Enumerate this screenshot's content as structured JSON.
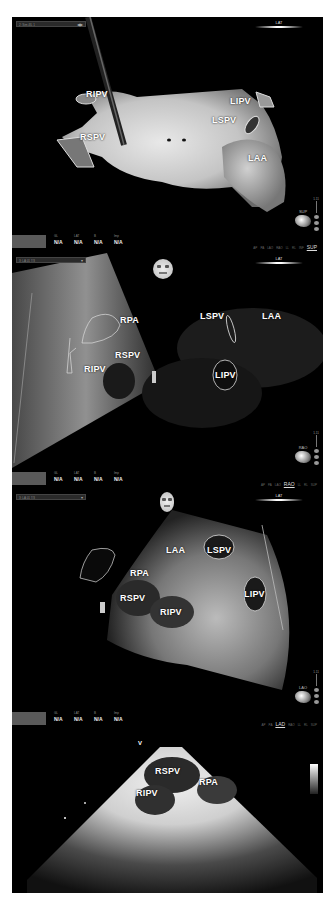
{
  "panels": [
    {
      "id": "A",
      "header": {
        "title": "2: Sim 4IL 1",
        "dropdown": "◀▶"
      },
      "orientation": "LAT",
      "labels": [
        "RIPV",
        "RSPV",
        "LIPV",
        "LSPV",
        "LAA"
      ],
      "view_label": "SUP",
      "status": {
        "keys": [
          "GL",
          "LAT",
          "B",
          "Imp"
        ],
        "values": [
          "N/A",
          "N/A",
          "N/A",
          "N/A"
        ],
        "nav_current": "SUP"
      },
      "scale_top": "1.11"
    },
    {
      "id": "B",
      "header": {
        "title": "3: LA 01 7/3",
        "dropdown": "▾"
      },
      "orientation": "LAT",
      "labels": [
        "RPA",
        "RSPV",
        "RIPV",
        "LSPV",
        "LAA",
        "LIPV"
      ],
      "view_label": "RAO",
      "status": {
        "keys": [
          "GL",
          "LAT",
          "B",
          "Imp"
        ],
        "values": [
          "N/A",
          "N/A",
          "N/A",
          "N/A"
        ],
        "nav_current": "RAO"
      },
      "scale_top": "1.11"
    },
    {
      "id": "C",
      "header": {
        "title": "3: LA 01 7/3",
        "dropdown": "▾"
      },
      "orientation": "LAT",
      "labels": [
        "LAA",
        "LSPV",
        "RPA",
        "RSPV",
        "RIPV",
        "LIPV"
      ],
      "view_label": "LAO",
      "status": {
        "keys": [
          "GL",
          "LAT",
          "B",
          "Imp"
        ],
        "values": [
          "N/A",
          "N/A",
          "N/A",
          "N/A"
        ],
        "nav_current": "LAD"
      },
      "scale_top": "1.11"
    },
    {
      "id": "D",
      "type": "ultrasound",
      "marker": "V",
      "labels": [
        "RSPV",
        "RPA",
        "RIPV"
      ]
    }
  ]
}
